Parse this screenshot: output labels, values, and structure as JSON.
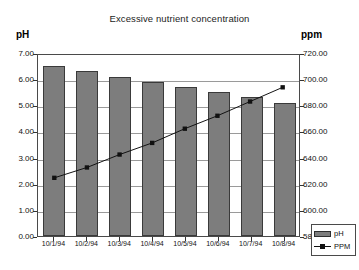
{
  "chart_data": {
    "type": "bar",
    "title": "Excessive nutrient concentration",
    "xlabel": "",
    "ylabel": "pH",
    "y2label": "ppm",
    "grid": true,
    "legend_position": "bottom-right",
    "categories": [
      "10/1/94",
      "10/2/94",
      "10/3/94",
      "10/4/94",
      "10/5/94",
      "10/6/94",
      "10/7/94",
      "10/8/94"
    ],
    "ylim": [
      0.0,
      7.0
    ],
    "ytick_labels": [
      "7.00",
      "6.00",
      "5.00",
      "4.00",
      "3.00",
      "2.00",
      "1.00",
      "0.00"
    ],
    "ytick_values": [
      7.0,
      6.0,
      5.0,
      4.0,
      3.0,
      2.0,
      1.0,
      0.0
    ],
    "y2lim": [
      580.0,
      720.0
    ],
    "y2tick_labels": [
      "720.00",
      "700.00",
      "680.00",
      "660.00",
      "640.00",
      "620.00",
      "600.00",
      "580.00"
    ],
    "y2tick_values": [
      720.0,
      700.0,
      680.0,
      660.0,
      640.0,
      620.0,
      600.0,
      580.0
    ],
    "series": [
      {
        "name": "pH",
        "type": "bar",
        "axis": "left",
        "color": "#7d7d7d",
        "values": [
          6.5,
          6.3,
          6.1,
          5.9,
          5.7,
          5.5,
          5.3,
          5.1
        ]
      },
      {
        "name": "PPM",
        "type": "line",
        "axis": "right",
        "color": "#111111",
        "marker": "square",
        "values": [
          625.0,
          633.0,
          643.0,
          652.0,
          663.0,
          673.0,
          684.0,
          695.0
        ]
      }
    ]
  },
  "legend": {
    "items": [
      {
        "label": "pH",
        "kind": "bar-swatch"
      },
      {
        "label": "PPM",
        "kind": "line-swatch"
      }
    ]
  }
}
